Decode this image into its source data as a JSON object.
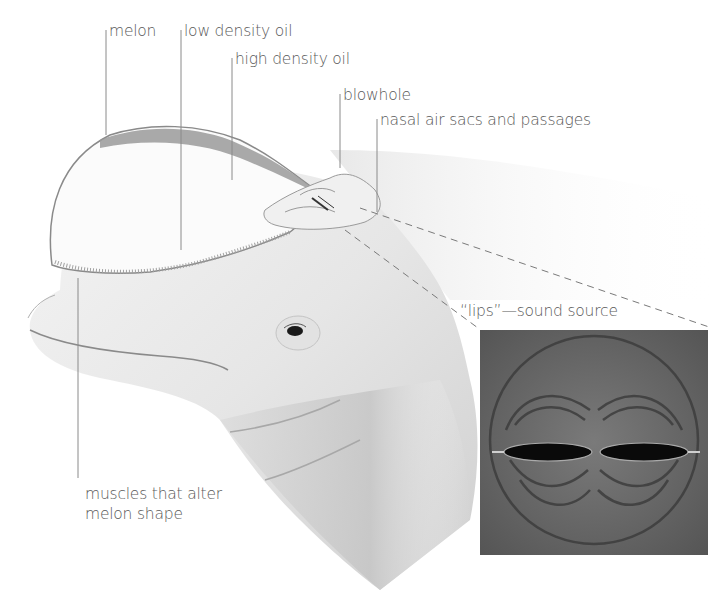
{
  "diagram": {
    "labels": [
      {
        "id": "melon",
        "text": "melon"
      },
      {
        "id": "low-density-oil",
        "text": "low density oil"
      },
      {
        "id": "high-density-oil",
        "text": "high density oil"
      },
      {
        "id": "blowhole",
        "text": "blowhole"
      },
      {
        "id": "nasal-air-sacs",
        "text": "nasal air sacs and passages"
      },
      {
        "id": "lips",
        "text": "“lips”—sound source"
      },
      {
        "id": "muscles",
        "text": "muscles that alter\nmelon shape"
      }
    ],
    "inset": {
      "name": "lips-sound-source-inset",
      "description": "Photoelastic pattern of two dark elliptical openings with concentric arcs"
    },
    "colors": {
      "background": "#ffffff",
      "label_text": "#5a5a5a",
      "leader_line": "#8a8a8a",
      "whale_skin": "#ececec",
      "whale_shadow": "#c8c8c8",
      "oil_band": "#9a9a9a",
      "inset_bg": "#6b6b6b",
      "inset_dark": "#0a0a0a"
    }
  }
}
